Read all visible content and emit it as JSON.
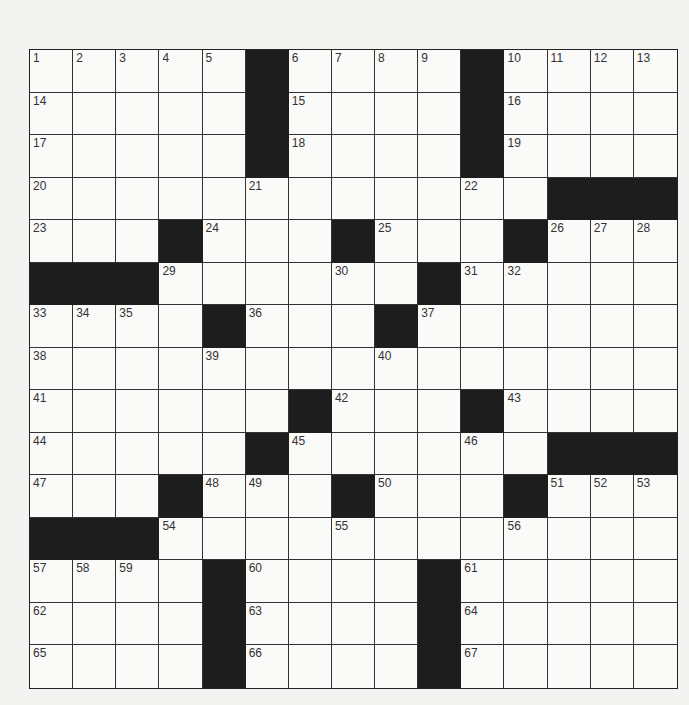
{
  "puzzle": {
    "rows": 15,
    "cols": 15,
    "colors": {
      "block": "#1d1d1d",
      "cell": "#fafaf8",
      "line": "#333333",
      "background": "#f3f3f1"
    },
    "layout": [
      "11111#1111#1111",
      "11111#1111#1111",
      "11111#1111#1111",
      "111111111111###",
      "111#111#111#111",
      "###111111#11111",
      "1111#111#111111",
      "111111111111111",
      "111111#111#1111",
      "11111#111111###",
      "111#111#111#111",
      "###111111111111",
      "1111#1111#11111",
      "1111#1111#11111",
      "1111#1111#11111"
    ],
    "numbers": {
      "0,0": "1",
      "0,1": "2",
      "0,2": "3",
      "0,3": "4",
      "0,4": "5",
      "0,6": "6",
      "0,7": "7",
      "0,8": "8",
      "0,9": "9",
      "0,11": "10",
      "0,12": "11",
      "0,13": "12",
      "0,14": "13",
      "1,0": "14",
      "1,6": "15",
      "1,11": "16",
      "2,0": "17",
      "2,6": "18",
      "2,11": "19",
      "3,0": "20",
      "3,5": "21",
      "3,10": "22",
      "4,0": "23",
      "4,4": "24",
      "4,8": "25",
      "4,12": "26",
      "4,13": "27",
      "4,14": "28",
      "5,3": "29",
      "5,7": "30",
      "5,10": "31",
      "5,11": "32",
      "6,0": "33",
      "6,1": "34",
      "6,2": "35",
      "6,5": "36",
      "6,9": "37",
      "7,0": "38",
      "7,4": "39",
      "7,8": "40",
      "8,0": "41",
      "8,7": "42",
      "8,11": "43",
      "9,0": "44",
      "9,6": "45",
      "9,10": "46",
      "10,0": "47",
      "10,4": "48",
      "10,5": "49",
      "10,8": "50",
      "10,12": "51",
      "10,13": "52",
      "10,14": "53",
      "11,3": "54",
      "11,7": "55",
      "11,11": "56",
      "12,0": "57",
      "12,1": "58",
      "12,2": "59",
      "12,5": "60",
      "12,10": "61",
      "13,0": "62",
      "13,5": "63",
      "13,10": "64",
      "14,0": "65",
      "14,5": "66",
      "14,10": "67"
    }
  }
}
